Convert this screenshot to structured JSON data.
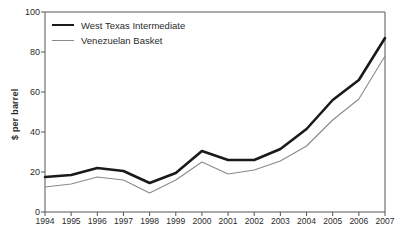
{
  "chart_data": {
    "type": "line",
    "title": "",
    "xlabel": "",
    "ylabel": "$ per barrel",
    "ylim": [
      0,
      100
    ],
    "yticks": [
      0,
      20,
      40,
      60,
      80,
      100
    ],
    "grid": false,
    "legend_position": "top-left",
    "categories": [
      "1994",
      "1995",
      "1996",
      "1997",
      "1998",
      "1999",
      "2000",
      "2001",
      "2002",
      "2003",
      "2004",
      "2005",
      "2006",
      "2007"
    ],
    "series": [
      {
        "name": "West Texas Intermediate",
        "color": "#1a1a1a",
        "width": 2.6,
        "values": [
          17.5,
          18.5,
          22,
          20.5,
          14.5,
          19.5,
          30.5,
          26,
          26,
          31.5,
          41.5,
          56,
          66,
          87
        ]
      },
      {
        "name": "Venezuelan Basket",
        "color": "#8a8a8a",
        "width": 1.1,
        "values": [
          12.5,
          14,
          17.5,
          16,
          9.5,
          16,
          25,
          19,
          21,
          25.5,
          33,
          46,
          56.5,
          78
        ]
      }
    ]
  },
  "axis": {
    "y_label": "$ per barrel",
    "y_tick_labels": [
      "0",
      "20",
      "40",
      "60",
      "80",
      "100"
    ],
    "x_tick_labels": [
      "1994",
      "1995",
      "1996",
      "1997",
      "1998",
      "1999",
      "2000",
      "2001",
      "2002",
      "2003",
      "2004",
      "2005",
      "2006",
      "2007"
    ]
  },
  "legend": {
    "items": [
      {
        "label": "West Texas Intermediate"
      },
      {
        "label": "Venezuelan Basket"
      }
    ]
  },
  "colors": {
    "background": "#ffffff",
    "axis": "#555555",
    "series_primary": "#1a1a1a",
    "series_secondary": "#8a8a8a",
    "text": "#2b2b2b"
  }
}
